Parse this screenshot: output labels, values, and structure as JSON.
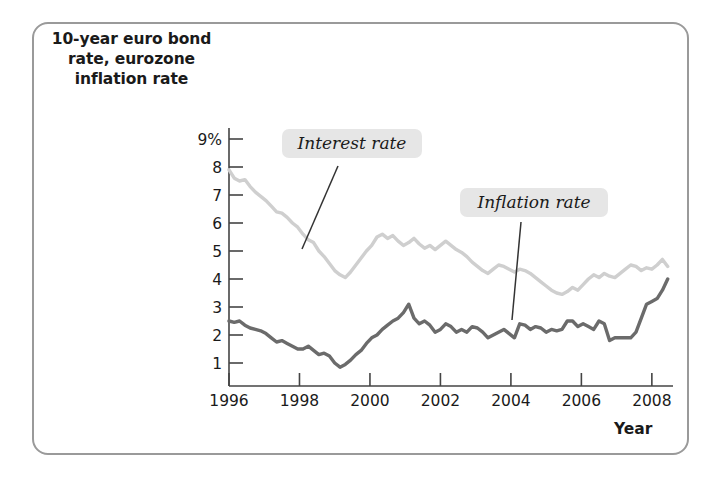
{
  "figure": {
    "title": "10-year euro bond rate, eurozone inflation rate",
    "title_line1": "10-year euro bond",
    "title_line2": "rate, eurozone",
    "title_line3": "inflation rate",
    "x_axis_label": "Year",
    "frame_color": "#9a9a9a",
    "background": "#ffffff"
  },
  "callouts": {
    "interest": "Interest rate",
    "inflation": "Inflation rate"
  },
  "chart_data": {
    "type": "line",
    "title": "10-year euro bond rate, eurozone inflation rate",
    "xlabel": "Year",
    "ylabel": "10-year euro bond rate, eurozone inflation rate",
    "xlim": [
      1996,
      2008.6
    ],
    "ylim": [
      0,
      9
    ],
    "grid": false,
    "legend_position": "inline-callouts",
    "xticks": [
      1996,
      1998,
      2000,
      2002,
      2004,
      2006,
      2008
    ],
    "xtick_labels": [
      "1996",
      "1998",
      "2000",
      "2002",
      "2004",
      "2006",
      "2008"
    ],
    "yticks": [
      1,
      2,
      3,
      4,
      5,
      6,
      7,
      8,
      9
    ],
    "ytick_labels": [
      "1",
      "2",
      "3",
      "4",
      "5",
      "6",
      "7",
      "8",
      "9%"
    ],
    "series": [
      {
        "name": "Interest rate",
        "color": "#cfcfcf",
        "label": "Interest rate",
        "x": [
          1996.0,
          1996.15,
          1996.3,
          1996.45,
          1996.6,
          1996.75,
          1996.9,
          1997.05,
          1997.2,
          1997.35,
          1997.5,
          1997.65,
          1997.8,
          1997.95,
          1998.1,
          1998.25,
          1998.4,
          1998.55,
          1998.7,
          1998.85,
          1999.0,
          1999.15,
          1999.3,
          1999.45,
          1999.6,
          1999.75,
          1999.9,
          2000.05,
          2000.2,
          2000.35,
          2000.5,
          2000.65,
          2000.8,
          2000.95,
          2001.1,
          2001.25,
          2001.4,
          2001.55,
          2001.7,
          2001.85,
          2002.0,
          2002.15,
          2002.3,
          2002.45,
          2002.6,
          2002.75,
          2002.9,
          2003.05,
          2003.2,
          2003.35,
          2003.5,
          2003.65,
          2003.8,
          2003.95,
          2004.1,
          2004.25,
          2004.4,
          2004.55,
          2004.7,
          2004.85,
          2005.0,
          2005.15,
          2005.3,
          2005.45,
          2005.6,
          2005.75,
          2005.9,
          2006.05,
          2006.2,
          2006.35,
          2006.5,
          2006.65,
          2006.8,
          2006.95,
          2007.1,
          2007.25,
          2007.4,
          2007.55,
          2007.7,
          2007.85,
          2008.0,
          2008.15,
          2008.3,
          2008.45
        ],
        "y": [
          7.9,
          7.6,
          7.5,
          7.55,
          7.3,
          7.1,
          6.95,
          6.8,
          6.6,
          6.4,
          6.35,
          6.2,
          6.0,
          5.85,
          5.6,
          5.4,
          5.3,
          5.0,
          4.8,
          4.55,
          4.3,
          4.15,
          4.05,
          4.25,
          4.5,
          4.75,
          5.0,
          5.2,
          5.5,
          5.6,
          5.45,
          5.55,
          5.35,
          5.2,
          5.3,
          5.45,
          5.25,
          5.1,
          5.2,
          5.05,
          5.2,
          5.35,
          5.2,
          5.05,
          4.95,
          4.8,
          4.6,
          4.45,
          4.3,
          4.2,
          4.35,
          4.5,
          4.45,
          4.35,
          4.25,
          4.35,
          4.3,
          4.2,
          4.05,
          3.9,
          3.75,
          3.6,
          3.5,
          3.45,
          3.55,
          3.7,
          3.6,
          3.8,
          4.0,
          4.15,
          4.05,
          4.2,
          4.1,
          4.05,
          4.2,
          4.35,
          4.5,
          4.45,
          4.3,
          4.4,
          4.35,
          4.5,
          4.7,
          4.45
        ]
      },
      {
        "name": "Inflation rate",
        "color": "#6b6b6b",
        "label": "Inflation rate",
        "x": [
          1996.0,
          1996.15,
          1996.3,
          1996.45,
          1996.6,
          1996.75,
          1996.9,
          1997.05,
          1997.2,
          1997.35,
          1997.5,
          1997.65,
          1997.8,
          1997.95,
          1998.1,
          1998.25,
          1998.4,
          1998.55,
          1998.7,
          1998.85,
          1999.0,
          1999.15,
          1999.3,
          1999.45,
          1999.6,
          1999.75,
          1999.9,
          2000.05,
          2000.2,
          2000.35,
          2000.5,
          2000.65,
          2000.8,
          2000.95,
          2001.1,
          2001.25,
          2001.4,
          2001.55,
          2001.7,
          2001.85,
          2002.0,
          2002.15,
          2002.3,
          2002.45,
          2002.6,
          2002.75,
          2002.9,
          2003.05,
          2003.2,
          2003.35,
          2003.5,
          2003.65,
          2003.8,
          2003.95,
          2004.1,
          2004.25,
          2004.4,
          2004.55,
          2004.7,
          2004.85,
          2005.0,
          2005.15,
          2005.3,
          2005.45,
          2005.6,
          2005.75,
          2005.9,
          2006.05,
          2006.2,
          2006.35,
          2006.5,
          2006.65,
          2006.8,
          2006.95,
          2007.1,
          2007.25,
          2007.4,
          2007.55,
          2007.7,
          2007.85,
          2008.0,
          2008.15,
          2008.3,
          2008.45
        ],
        "y": [
          2.5,
          2.45,
          2.5,
          2.35,
          2.25,
          2.2,
          2.15,
          2.05,
          1.9,
          1.75,
          1.8,
          1.7,
          1.6,
          1.5,
          1.5,
          1.6,
          1.45,
          1.3,
          1.35,
          1.25,
          1.0,
          0.85,
          0.95,
          1.1,
          1.3,
          1.45,
          1.7,
          1.9,
          2.0,
          2.2,
          2.35,
          2.5,
          2.6,
          2.8,
          3.1,
          2.6,
          2.4,
          2.5,
          2.35,
          2.1,
          2.2,
          2.4,
          2.3,
          2.1,
          2.2,
          2.1,
          2.3,
          2.25,
          2.1,
          1.9,
          2.0,
          2.1,
          2.2,
          2.05,
          1.9,
          2.4,
          2.35,
          2.2,
          2.3,
          2.25,
          2.1,
          2.2,
          2.15,
          2.2,
          2.5,
          2.5,
          2.3,
          2.4,
          2.3,
          2.2,
          2.5,
          2.4,
          1.8,
          1.9,
          1.9,
          1.9,
          1.9,
          2.1,
          2.6,
          3.1,
          3.2,
          3.3,
          3.6,
          4.0
        ]
      }
    ]
  }
}
